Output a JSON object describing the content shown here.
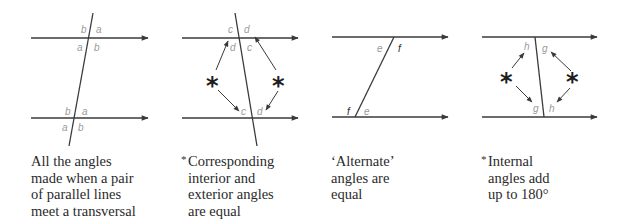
{
  "colors": {
    "line": "#3a3a3a",
    "arrow": "#3a3a3a",
    "label_gray": "#9a9a9a",
    "label_dark": "#2a2a2a",
    "text": "#2a2a2a",
    "background": "#ffffff"
  },
  "diagrams": [
    {
      "id": "all-angles",
      "angle_labels": {
        "top_left_above": "b",
        "top_right_above": "a",
        "top_left_below": "a",
        "top_right_below": "b",
        "bottom_left_above": "b",
        "bottom_right_above": "a",
        "bottom_left_below": "a",
        "bottom_right_below": "b"
      },
      "caption": {
        "asterisk": "",
        "lines": [
          "All the angles",
          "made when a pair",
          "of parallel lines",
          "meet a transversal"
        ]
      }
    },
    {
      "id": "corresponding-angles",
      "angle_labels": {
        "top_left_above": "c",
        "top_right_above": "d",
        "top_left_below": "d",
        "top_right_below": "c",
        "bottom_left_above": "c",
        "bottom_right_above": "d"
      },
      "markers": [
        "*",
        "*"
      ],
      "caption": {
        "asterisk": "*",
        "lines": [
          "Corresponding",
          "interior and",
          "exterior angles",
          "are equal"
        ]
      }
    },
    {
      "id": "alternate-angles",
      "angle_labels": {
        "top_left_below": "e",
        "top_right_below": "f",
        "bottom_left_above": "f",
        "bottom_right_above": "e"
      },
      "caption": {
        "asterisk": "",
        "lines": [
          "‘Alternate’",
          "angles are",
          "equal"
        ]
      }
    },
    {
      "id": "internal-angles",
      "angle_labels": {
        "top_left_below": "h",
        "top_right_below": "g",
        "bottom_left_above": "g",
        "bottom_right_above": "h"
      },
      "markers": [
        "*",
        "*"
      ],
      "caption": {
        "asterisk": "*",
        "lines": [
          "Internal",
          "angles add",
          "up to 180°"
        ]
      }
    }
  ]
}
